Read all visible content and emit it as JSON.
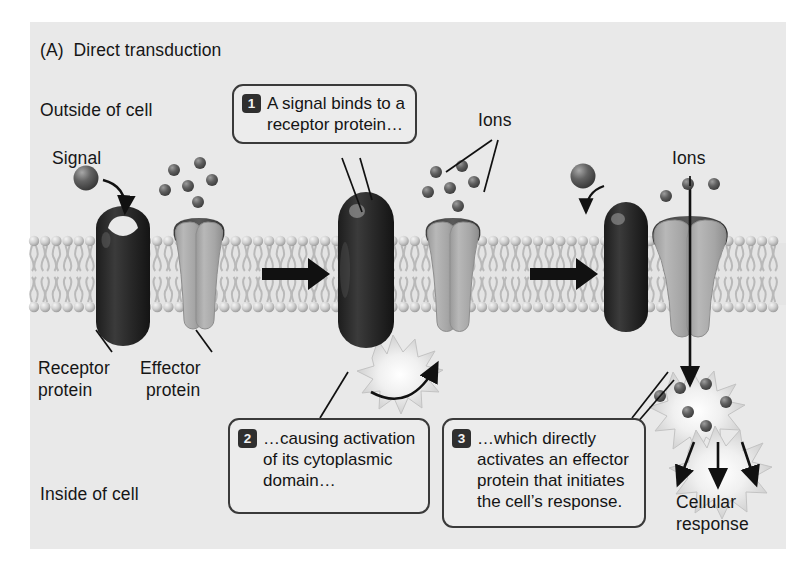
{
  "figure": {
    "title": "(A)  Direct transduction",
    "background_color": "#e9e9e9",
    "page_color": "#ffffff"
  },
  "labels": {
    "outside_of_cell": "Outside of cell",
    "inside_of_cell": "Inside of cell",
    "signal": "Signal",
    "receptor_protein_line1": "Receptor",
    "receptor_protein_line2": "protein",
    "effector_protein_line1": "Effector",
    "effector_protein_line2": "protein",
    "ions_middle": "Ions",
    "ions_right": "Ions",
    "cellular_response_line1": "Cellular",
    "cellular_response_line2": "response"
  },
  "callouts": [
    {
      "number": "1",
      "lines": [
        "A signal binds to a",
        "receptor protein…"
      ]
    },
    {
      "number": "2",
      "lines": [
        "…causing activation",
        "of its cytoplasmic",
        "domain…"
      ]
    },
    {
      "number": "3",
      "lines": [
        "…which directly",
        "activates an effector",
        "protein that initiates",
        "the cell’s response."
      ]
    }
  ],
  "colors": {
    "receptor_protein": "#2b2b2b",
    "effector_protein": "#a9a9a9",
    "effector_protein_cap": "#4a4a4a",
    "membrane_head": "#c9c9c9",
    "ion": "#5b5b5b",
    "signal_sphere": "#555555",
    "burst": "#d0d0d0",
    "arrow": "#111111",
    "text": "#161616"
  },
  "diagram": {
    "stages": [
      "resting receptor and closed effector channel",
      "signal bound, cytoplasmic domain activated",
      "effector channel opened, ions flow, cellular response"
    ],
    "membrane_top_y": 236,
    "membrane_bottom_y": 310,
    "block_arrows": 2,
    "ion_count_middle_cluster": 6,
    "ion_count_right_outside": 3,
    "ion_count_right_inside": 6
  }
}
